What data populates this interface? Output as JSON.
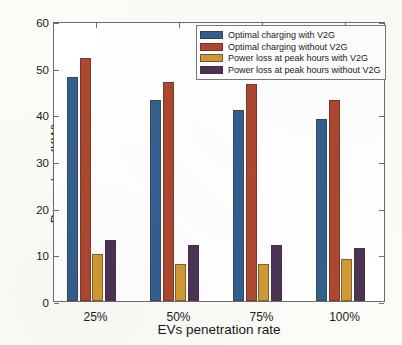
{
  "chart_data": {
    "type": "bar",
    "title": "",
    "xlabel": "EVs penetration rate",
    "ylabel": "Power loss (KW)",
    "categories": [
      "25%",
      "50%",
      "75%",
      "100%"
    ],
    "ylim": [
      0,
      60
    ],
    "yticks": [
      0,
      10,
      20,
      30,
      40,
      50,
      60
    ],
    "ytick_labels": [
      "0",
      "10",
      "20",
      "30",
      "40",
      "50",
      "60"
    ],
    "grid": false,
    "legend_position": "top-right",
    "series": [
      {
        "name": "Optimal charging with V2G",
        "color": "#32608d",
        "values": [
          48,
          43,
          41,
          39
        ]
      },
      {
        "name": "Optimal charging without V2G",
        "color": "#ad4730",
        "values": [
          52,
          47,
          46.5,
          43
        ]
      },
      {
        "name": "Power loss at peak hours with V2G",
        "color": "#cf9a34",
        "values": [
          10,
          8,
          8,
          9
        ]
      },
      {
        "name": "Power loss at peak hours without V2G",
        "color": "#4c3356",
        "values": [
          13,
          12,
          12,
          11.3
        ]
      }
    ]
  }
}
